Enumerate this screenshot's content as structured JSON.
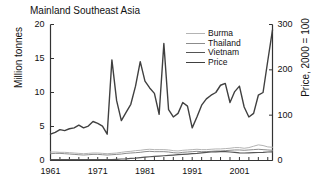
{
  "chart_data": {
    "type": "line",
    "title": "Mainland Southeast Asia",
    "xlabel": "",
    "ylabel": "Million tonnes",
    "y2label": "Price, 2000 = 100",
    "xlim": [
      1961,
      2008
    ],
    "ylim": [
      0,
      20
    ],
    "y2lim": [
      0,
      300
    ],
    "yticks": [
      "0",
      "5",
      "10",
      "15",
      "20"
    ],
    "ytick_values": [
      0,
      5,
      10,
      15,
      20
    ],
    "y2ticks": [
      "0",
      "100",
      "200",
      "300"
    ],
    "y2tick_values": [
      0,
      100,
      200,
      300
    ],
    "xticks": [
      "1961",
      "1971",
      "1981",
      "1991",
      "2001"
    ],
    "xtick_values": [
      1961,
      1971,
      1981,
      1991,
      2001
    ],
    "grid": false,
    "legend_position": "upper-right",
    "x": [
      1961,
      1962,
      1963,
      1964,
      1965,
      1966,
      1967,
      1968,
      1969,
      1970,
      1971,
      1972,
      1973,
      1974,
      1975,
      1976,
      1977,
      1978,
      1979,
      1980,
      1981,
      1982,
      1983,
      1984,
      1985,
      1986,
      1987,
      1988,
      1989,
      1990,
      1991,
      1992,
      1993,
      1994,
      1995,
      1996,
      1997,
      1998,
      1999,
      2000,
      2001,
      2002,
      2003,
      2004,
      2005,
      2006,
      2007,
      2008
    ],
    "series": [
      {
        "name": "Burma",
        "axis": "left",
        "color": "#b4b4b4",
        "width": 1.0,
        "values": [
          1.25,
          1.25,
          1.2,
          1.2,
          1.15,
          1.1,
          1.05,
          1.0,
          1.05,
          1.1,
          1.1,
          1.05,
          1.0,
          1.05,
          1.1,
          1.2,
          1.3,
          1.35,
          1.45,
          1.5,
          1.6,
          1.65,
          1.6,
          1.6,
          1.6,
          1.55,
          1.45,
          1.4,
          1.5,
          1.55,
          1.6,
          1.65,
          1.6,
          1.6,
          1.65,
          1.7,
          1.7,
          1.75,
          1.8,
          1.9,
          1.9,
          1.8,
          1.9,
          2.1,
          2.3,
          2.2,
          2.0,
          1.95
        ]
      },
      {
        "name": "Thailand",
        "axis": "left",
        "color": "#8c8c8c",
        "width": 1.0,
        "values": [
          1.0,
          1.05,
          1.05,
          1.0,
          0.95,
          0.9,
          0.85,
          0.8,
          0.85,
          0.9,
          0.9,
          0.85,
          0.8,
          0.85,
          0.9,
          0.95,
          1.05,
          1.1,
          1.15,
          1.2,
          1.3,
          1.35,
          1.3,
          1.3,
          1.3,
          1.25,
          1.15,
          1.1,
          1.2,
          1.25,
          1.3,
          1.35,
          1.3,
          1.3,
          1.35,
          1.4,
          1.4,
          1.45,
          1.5,
          1.55,
          1.55,
          1.5,
          1.55,
          1.6,
          1.65,
          1.6,
          1.55,
          1.5
        ]
      },
      {
        "name": "Vietnam",
        "axis": "left",
        "color": "#555555",
        "width": 1.2,
        "values": [
          0.12,
          0.12,
          0.12,
          0.12,
          0.12,
          0.12,
          0.12,
          0.12,
          0.12,
          0.12,
          0.12,
          0.12,
          0.12,
          0.15,
          0.18,
          0.22,
          0.25,
          0.3,
          0.35,
          0.42,
          0.5,
          0.55,
          0.6,
          0.65,
          0.7,
          0.75,
          0.8,
          0.85,
          0.9,
          0.95,
          1.0,
          1.05,
          1.12,
          1.2,
          1.25,
          1.28,
          1.3,
          1.3,
          1.25,
          1.2,
          1.12,
          1.1,
          1.12,
          1.15,
          1.18,
          1.2,
          1.25,
          1.28
        ]
      },
      {
        "name": "Price",
        "axis": "right",
        "color": "#404040",
        "width": 1.4,
        "values": [
          58,
          62,
          68,
          66,
          70,
          72,
          78,
          72,
          76,
          86,
          82,
          76,
          58,
          222,
          132,
          88,
          106,
          124,
          164,
          218,
          175,
          160,
          148,
          102,
          258,
          112,
          96,
          104,
          128,
          120,
          72,
          96,
          122,
          136,
          144,
          150,
          166,
          170,
          128,
          152,
          164,
          118,
          96,
          104,
          144,
          150,
          220,
          288
        ]
      }
    ]
  },
  "legend": {
    "items": [
      {
        "label": "Burma"
      },
      {
        "label": "Thailand"
      },
      {
        "label": "Vietnam"
      },
      {
        "label": "Price"
      }
    ]
  }
}
